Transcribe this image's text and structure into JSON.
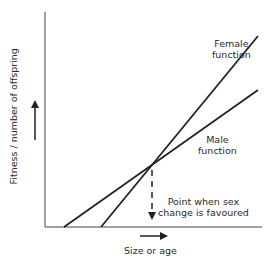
{
  "diagram": {
    "y_axis_label": "Fitness / number of offspring",
    "x_axis_label": "Size or age",
    "lines": [
      {
        "name": "Female function",
        "label_line1": "Female",
        "label_line2": "function"
      },
      {
        "name": "Male function",
        "label_line1": "Male",
        "label_line2": "function"
      }
    ],
    "annotation": {
      "line1": "Point when sex",
      "line2": "change is favoured"
    },
    "colors": {
      "line": "#222222",
      "background": "#ffffff"
    }
  }
}
